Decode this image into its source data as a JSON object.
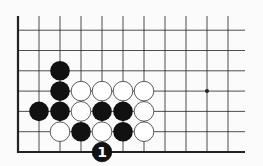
{
  "diagram": {
    "type": "go-board-fragment",
    "grid": {
      "x0": 18,
      "dx": 21,
      "cols": 11,
      "right_edge": 245,
      "bottom_y": 152,
      "dy": 20.3,
      "rows": 7,
      "top_y": 16
    },
    "hoshi": [
      {
        "c": 9,
        "r": 3
      }
    ],
    "black_stones": [
      {
        "c": 2,
        "r": 4
      },
      {
        "c": 2,
        "r": 3
      },
      {
        "c": 1,
        "r": 2
      },
      {
        "c": 2,
        "r": 2
      },
      {
        "c": 4,
        "r": 2
      },
      {
        "c": 5,
        "r": 2
      },
      {
        "c": 3,
        "r": 1
      },
      {
        "c": 5,
        "r": 1
      }
    ],
    "white_stones": [
      {
        "c": 3,
        "r": 3
      },
      {
        "c": 4,
        "r": 3
      },
      {
        "c": 5,
        "r": 3
      },
      {
        "c": 6,
        "r": 3
      },
      {
        "c": 3,
        "r": 2
      },
      {
        "c": 6,
        "r": 2
      },
      {
        "c": 2,
        "r": 1
      },
      {
        "c": 4,
        "r": 1
      },
      {
        "c": 6,
        "r": 1
      }
    ],
    "numbered_stones": [
      {
        "c": 4,
        "r": 0,
        "color": "black",
        "label": "1"
      }
    ],
    "colors": {
      "line": "#222222",
      "black": "#111111",
      "white": "#ffffff",
      "background": "#fbfbfb"
    }
  }
}
